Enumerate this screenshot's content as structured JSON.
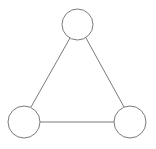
{
  "diagram": {
    "type": "graph",
    "width": 156,
    "height": 149,
    "stroke_color": "#7a7a7a",
    "fill_color": "#ffffff",
    "nodes": [
      {
        "id": "top",
        "cx": 77.5,
        "cy": 24.5,
        "r": 15.5
      },
      {
        "id": "bottom-left",
        "cx": 24,
        "cy": 122,
        "r": 16
      },
      {
        "id": "bottom-right",
        "cx": 130,
        "cy": 122,
        "r": 16
      }
    ],
    "edges": [
      {
        "from": "top",
        "to": "bottom-left",
        "x1": 70,
        "y1": 38,
        "x2": 31,
        "y2": 107
      },
      {
        "from": "top",
        "to": "bottom-right",
        "x1": 86,
        "y1": 38,
        "x2": 124,
        "y2": 107
      },
      {
        "from": "bottom-left",
        "to": "bottom-right",
        "x1": 40,
        "y1": 122,
        "x2": 114,
        "y2": 122
      }
    ]
  }
}
